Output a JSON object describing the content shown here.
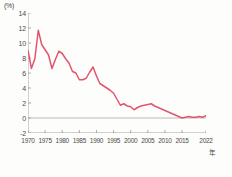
{
  "chart_data": {
    "type": "line",
    "title": "",
    "subtitle": "",
    "unit_label": "(%)",
    "xlabel": "年",
    "ylabel": "",
    "ylim": [
      -2,
      14
    ],
    "xlim": [
      1970,
      2022
    ],
    "yticks": [
      14,
      12,
      10,
      8,
      6,
      4,
      2,
      0,
      -2
    ],
    "xticks": [
      1970,
      1975,
      1980,
      1985,
      1990,
      1995,
      2000,
      2005,
      2010,
      2015,
      2022
    ],
    "grid": false,
    "legend": "none",
    "zero_line": true,
    "line_color": "#e2556e",
    "axis_color": "#9a9a9a",
    "series": [
      {
        "name": "率",
        "x": [
          1970,
          1971,
          1972,
          1973,
          1974,
          1975,
          1976,
          1977,
          1978,
          1979,
          1980,
          1981,
          1982,
          1983,
          1984,
          1985,
          1986,
          1987,
          1988,
          1989,
          1990,
          1991,
          1992,
          1993,
          1994,
          1995,
          1996,
          1997,
          1998,
          1999,
          2000,
          2001,
          2002,
          2003,
          2004,
          2005,
          2006,
          2007,
          2008,
          2009,
          2010,
          2011,
          2012,
          2013,
          2014,
          2015,
          2016,
          2017,
          2018,
          2019,
          2020,
          2021,
          2022
        ],
        "values": [
          9.0,
          6.6,
          7.9,
          11.7,
          9.8,
          9.1,
          8.4,
          6.6,
          7.8,
          8.9,
          8.6,
          7.9,
          7.3,
          6.2,
          6.0,
          5.1,
          5.1,
          5.3,
          6.1,
          6.8,
          5.6,
          4.6,
          4.3,
          4.0,
          3.7,
          3.3,
          2.5,
          1.7,
          1.9,
          1.6,
          1.5,
          1.1,
          1.4,
          1.6,
          1.7,
          1.8,
          1.9,
          1.6,
          1.4,
          1.2,
          1.0,
          0.8,
          0.6,
          0.4,
          0.2,
          0.0,
          0.1,
          0.2,
          0.1,
          0.1,
          0.2,
          0.1,
          0.3
        ]
      }
    ]
  },
  "axis": {
    "y_tick_labels": [
      "14",
      "12",
      "10",
      "8",
      "6",
      "4",
      "2",
      "0",
      "-2"
    ],
    "x_tick_labels": [
      "1970",
      "1975",
      "1980",
      "1985",
      "1990",
      "1995",
      "2000",
      "2005",
      "2010",
      "2015",
      "2022"
    ],
    "x_unit": "年",
    "y_unit": "(%)"
  }
}
